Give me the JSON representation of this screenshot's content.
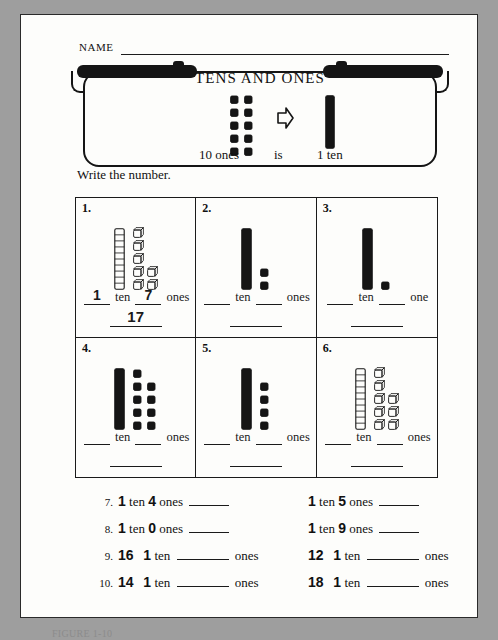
{
  "page": {
    "name_label": "NAME",
    "instruction": "Write the number.",
    "caption": "FIGURE 1-10"
  },
  "banner": {
    "title": "TENS AND ONES",
    "caption_ones": "10 ones",
    "caption_is": "is",
    "caption_ten": "1 ten",
    "ones_count": 10,
    "arrow_icon": "right-arrow-outline-icon",
    "rod_style": "filled"
  },
  "grid": {
    "cells": [
      {
        "number": "1.",
        "rod_style": "outline",
        "ones_count": 7,
        "ones_style": "outline",
        "label_ten": "ten",
        "label_ones": "ones",
        "answer_tens": "1",
        "answer_ones": "7",
        "answer_total": "17"
      },
      {
        "number": "2.",
        "rod_style": "filled",
        "ones_count": 2,
        "ones_style": "filled",
        "label_ten": "ten",
        "label_ones": "ones",
        "answer_tens": "",
        "answer_ones": "",
        "answer_total": ""
      },
      {
        "number": "3.",
        "rod_style": "filled",
        "ones_count": 1,
        "ones_style": "filled",
        "label_ten": "ten",
        "label_ones": "one",
        "answer_tens": "",
        "answer_ones": "",
        "answer_total": ""
      },
      {
        "number": "4.",
        "rod_style": "filled",
        "ones_count": 9,
        "ones_style": "filled",
        "label_ten": "ten",
        "label_ones": "ones",
        "answer_tens": "",
        "answer_ones": "",
        "answer_total": ""
      },
      {
        "number": "5.",
        "rod_style": "filled",
        "ones_count": 4,
        "ones_style": "filled",
        "label_ten": "ten",
        "label_ones": "ones",
        "answer_tens": "",
        "answer_ones": "",
        "answer_total": ""
      },
      {
        "number": "6.",
        "rod_style": "outline",
        "ones_count": 8,
        "ones_style": "outline",
        "label_ten": "ten",
        "label_ones": "ones",
        "answer_tens": "",
        "answer_ones": "",
        "answer_total": ""
      }
    ]
  },
  "exercises": {
    "rows": [
      {
        "left": {
          "index": "7.",
          "form": "tens-ones-to-number",
          "tens": "1",
          "ones": "4",
          "word_ten": "ten",
          "word_ones": "ones",
          "answer": ""
        },
        "right": {
          "index": "",
          "form": "tens-ones-to-number",
          "tens": "1",
          "ones": "5",
          "word_ten": "ten",
          "word_ones": "ones",
          "answer": ""
        }
      },
      {
        "left": {
          "index": "8.",
          "form": "tens-ones-to-number",
          "tens": "1",
          "ones": "0",
          "word_ten": "ten",
          "word_ones": "ones",
          "answer": ""
        },
        "right": {
          "index": "",
          "form": "tens-ones-to-number",
          "tens": "1",
          "ones": "9",
          "word_ten": "ten",
          "word_ones": "ones",
          "answer": ""
        }
      },
      {
        "left": {
          "index": "9.",
          "form": "number-to-ones",
          "number": "16",
          "tens": "1",
          "word_ten": "ten",
          "word_ones": "ones",
          "answer": ""
        },
        "right": {
          "index": "",
          "form": "number-to-ones",
          "number": "12",
          "tens": "1",
          "word_ten": "ten",
          "word_ones": "ones",
          "answer": ""
        }
      },
      {
        "left": {
          "index": "10.",
          "form": "number-to-ones",
          "number": "14",
          "tens": "1",
          "word_ten": "ten",
          "word_ones": "ones",
          "answer": ""
        },
        "right": {
          "index": "",
          "form": "number-to-ones",
          "number": "18",
          "tens": "1",
          "word_ten": "ten",
          "word_ones": "ones",
          "answer": ""
        }
      }
    ]
  },
  "colors": {
    "ink": "#151515",
    "paper": "#fdfdfb",
    "background": "#9e9e9e"
  }
}
